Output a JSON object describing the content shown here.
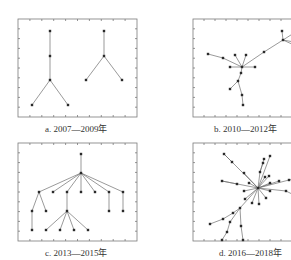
{
  "figure": {
    "panels": [
      {
        "id": "a",
        "caption": "a. 2007—2009年",
        "frame": [
          18,
          19,
          119,
          98
        ],
        "nodes": [
          [
            50,
            31
          ],
          [
            50,
            56
          ],
          [
            50,
            80
          ],
          [
            32,
            105
          ],
          [
            68,
            105
          ],
          [
            104,
            31
          ],
          [
            104,
            56
          ],
          [
            86,
            80
          ],
          [
            122,
            80
          ]
        ],
        "edges": [
          [
            0,
            1
          ],
          [
            1,
            2
          ],
          [
            2,
            3
          ],
          [
            2,
            4
          ],
          [
            5,
            6
          ],
          [
            6,
            7
          ],
          [
            6,
            8
          ]
        ]
      },
      {
        "id": "b",
        "caption": "b. 2010—2012年",
        "frame": [
          193,
          19,
          110,
          98
        ],
        "nodes": [
          [
            242,
            67
          ],
          [
            208,
            54
          ],
          [
            223,
            58
          ],
          [
            235,
            55
          ],
          [
            246,
            55
          ],
          [
            230,
            67
          ],
          [
            255,
            67
          ],
          [
            241,
            73
          ],
          [
            238,
            81
          ],
          [
            230,
            89
          ],
          [
            242,
            95
          ],
          [
            243,
            105
          ],
          [
            264,
            52
          ],
          [
            283,
            40
          ],
          [
            282,
            31
          ],
          [
            294,
            33
          ],
          [
            294,
            42
          ],
          [
            294,
            45
          ]
        ],
        "edges": [
          [
            0,
            2
          ],
          [
            2,
            1
          ],
          [
            0,
            3
          ],
          [
            0,
            4
          ],
          [
            0,
            5
          ],
          [
            0,
            6
          ],
          [
            0,
            7
          ],
          [
            7,
            8
          ],
          [
            8,
            9
          ],
          [
            8,
            10
          ],
          [
            10,
            11
          ],
          [
            0,
            12
          ],
          [
            12,
            13
          ],
          [
            13,
            14
          ],
          [
            13,
            15
          ],
          [
            13,
            16
          ],
          [
            13,
            17
          ]
        ]
      },
      {
        "id": "c",
        "caption": "c. 2013—2015年",
        "frame": [
          18,
          143,
          119,
          98
        ],
        "nodes": [
          [
            81,
            154
          ],
          [
            81,
            173
          ],
          [
            39,
            192
          ],
          [
            53,
            192
          ],
          [
            67,
            192
          ],
          [
            81,
            192
          ],
          [
            95,
            192
          ],
          [
            109,
            192
          ],
          [
            123,
            192
          ],
          [
            32,
            211
          ],
          [
            46,
            211
          ],
          [
            67,
            211
          ],
          [
            109,
            211
          ],
          [
            123,
            211
          ],
          [
            32,
            230
          ],
          [
            46,
            230
          ],
          [
            60,
            230
          ],
          [
            74,
            230
          ],
          [
            88,
            230
          ]
        ],
        "edges": [
          [
            0,
            1
          ],
          [
            1,
            2
          ],
          [
            1,
            3
          ],
          [
            1,
            4
          ],
          [
            1,
            5
          ],
          [
            1,
            6
          ],
          [
            1,
            7
          ],
          [
            1,
            8
          ],
          [
            2,
            9
          ],
          [
            2,
            10
          ],
          [
            9,
            14
          ],
          [
            4,
            11
          ],
          [
            11,
            15
          ],
          [
            11,
            16
          ],
          [
            11,
            17
          ],
          [
            11,
            18
          ],
          [
            7,
            12
          ],
          [
            8,
            13
          ]
        ]
      },
      {
        "id": "d",
        "caption": "d. 2016—2018年",
        "frame": [
          193,
          143,
          110,
          98
        ],
        "nodes": [
          [
            258,
            188
          ],
          [
            224,
            154
          ],
          [
            232,
            162
          ],
          [
            244,
            173
          ],
          [
            222,
            181
          ],
          [
            237,
            184
          ],
          [
            249,
            183
          ],
          [
            244,
            191
          ],
          [
            245,
            199
          ],
          [
            252,
            203
          ],
          [
            259,
            204
          ],
          [
            266,
            198
          ],
          [
            270,
            191
          ],
          [
            270,
            183
          ],
          [
            265,
            177
          ],
          [
            260,
            172
          ],
          [
            263,
            163
          ],
          [
            264,
            159
          ],
          [
            270,
            156
          ],
          [
            269,
            176
          ],
          [
            279,
            181
          ],
          [
            286,
            191
          ],
          [
            296,
            196
          ],
          [
            289,
            180
          ],
          [
            299,
            178
          ],
          [
            240,
            208
          ],
          [
            233,
            213
          ],
          [
            223,
            219
          ],
          [
            210,
            224
          ],
          [
            230,
            222
          ],
          [
            227,
            232
          ],
          [
            222,
            240
          ],
          [
            241,
            226
          ],
          [
            243,
            240
          ]
        ],
        "edges": [
          [
            0,
            1
          ],
          [
            1,
            2
          ],
          [
            0,
            3
          ],
          [
            0,
            4
          ],
          [
            4,
            5
          ],
          [
            0,
            6
          ],
          [
            0,
            7
          ],
          [
            0,
            8
          ],
          [
            0,
            9
          ],
          [
            0,
            10
          ],
          [
            0,
            11
          ],
          [
            0,
            12
          ],
          [
            0,
            13
          ],
          [
            0,
            14
          ],
          [
            0,
            15
          ],
          [
            15,
            16
          ],
          [
            15,
            17
          ],
          [
            0,
            18
          ],
          [
            0,
            19
          ],
          [
            0,
            20
          ],
          [
            0,
            21
          ],
          [
            21,
            22
          ],
          [
            0,
            23
          ],
          [
            23,
            24
          ],
          [
            0,
            25
          ],
          [
            25,
            26
          ],
          [
            26,
            27
          ],
          [
            27,
            28
          ],
          [
            25,
            29
          ],
          [
            29,
            30
          ],
          [
            30,
            31
          ],
          [
            25,
            32
          ],
          [
            32,
            33
          ]
        ]
      }
    ]
  }
}
